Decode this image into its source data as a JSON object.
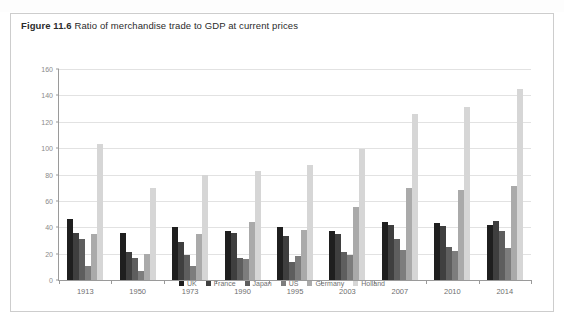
{
  "figure": {
    "number": "Figure 11.6",
    "title": "Ratio of merchandise trade to GDP at current prices"
  },
  "chart_data": {
    "type": "bar",
    "title": "Ratio of merchandise trade to GDP at current prices",
    "xlabel": "",
    "ylabel": "",
    "ylim": [
      0,
      160
    ],
    "yticks": [
      0,
      20,
      40,
      60,
      80,
      100,
      120,
      140,
      160
    ],
    "ytick_labels": [
      "0",
      "20",
      "40",
      "60",
      "80",
      "100",
      "120",
      "140",
      "160"
    ],
    "grid": true,
    "legend_position": "bottom",
    "categories": [
      "1913",
      "1950",
      "1973",
      "1990",
      "1995",
      "2003",
      "2007",
      "2010",
      "2014"
    ],
    "series": [
      {
        "name": "UK",
        "color": "#1f1f1f",
        "values": [
          46,
          36,
          40,
          37,
          40,
          37,
          44,
          43,
          42
        ]
      },
      {
        "name": "France",
        "color": "#3f3f3f",
        "values": [
          36,
          21,
          29,
          36,
          33,
          35,
          42,
          41,
          45
        ]
      },
      {
        "name": "Japan",
        "color": "#5e5e5e",
        "values": [
          31,
          17,
          19,
          17,
          14,
          21,
          31,
          25,
          37
        ]
      },
      {
        "name": "US",
        "color": "#7d7d7d",
        "values": [
          11,
          7,
          11,
          16,
          18,
          19,
          23,
          22,
          24
        ]
      },
      {
        "name": "Germany",
        "color": "#aaaaaa",
        "values": [
          35,
          20,
          35,
          44,
          38,
          55,
          70,
          68,
          71
        ]
      },
      {
        "name": "Holland",
        "color": "#d6d6d6",
        "values": [
          103,
          70,
          80,
          83,
          87,
          99,
          126,
          131,
          145
        ]
      }
    ]
  }
}
